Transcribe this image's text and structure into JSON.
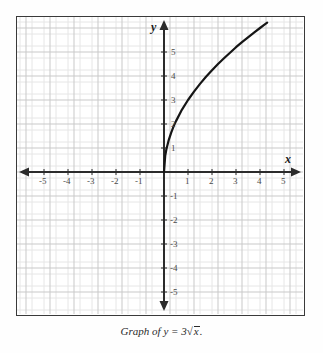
{
  "caption": {
    "prefix": "Graph of",
    "lhs": "y",
    "equals": "=",
    "coefficient": "3",
    "radical_symbol": "√",
    "radicand": "x",
    "period": "."
  },
  "axes": {
    "x_label": "x",
    "y_label": "y",
    "x_tick_labels": [
      "-5",
      "-4",
      "-3",
      "-2",
      "-1",
      "1",
      "2",
      "3",
      "4",
      "5"
    ],
    "y_tick_labels": [
      "5",
      "4",
      "3",
      "2",
      "1",
      "-1",
      "-2",
      "-3",
      "-4",
      "-5"
    ]
  },
  "colors": {
    "frame": "#3a3a3a",
    "axis": "#2b2b2b",
    "curve": "#151515",
    "major_grid": "#c9c9c9",
    "minor_grid": "#e6e6e6",
    "label": "#4a4a4a",
    "background": "#ffffff"
  },
  "chart_data": {
    "type": "line",
    "function": "y = 3*sqrt(x)",
    "xlabel": "x",
    "ylabel": "y",
    "xlim": [
      -6.0,
      5.9
    ],
    "ylim": [
      -6.2,
      6.2
    ],
    "xticks": [
      -5,
      -4,
      -3,
      -2,
      -1,
      1,
      2,
      3,
      4,
      5
    ],
    "yticks": [
      -5,
      -4,
      -3,
      -2,
      -1,
      1,
      2,
      3,
      4,
      5
    ],
    "grid": true,
    "minor_grid_divisions": 2,
    "legend": null,
    "series": [
      {
        "name": "y = 3√x",
        "domain": [
          0,
          4.3
        ],
        "x": [
          0,
          0.05,
          0.1,
          0.2,
          0.3,
          0.4,
          0.5,
          0.75,
          1.0,
          1.25,
          1.5,
          1.75,
          2.0,
          2.25,
          2.5,
          2.75,
          3.0,
          3.25,
          3.5,
          3.75,
          4.0,
          4.2,
          4.3
        ],
        "y": [
          0,
          0.67,
          0.95,
          1.34,
          1.64,
          1.9,
          2.12,
          2.6,
          3.0,
          3.35,
          3.67,
          3.97,
          4.24,
          4.5,
          4.74,
          4.97,
          5.2,
          5.41,
          5.61,
          5.81,
          6.0,
          6.15,
          6.22
        ]
      }
    ]
  }
}
